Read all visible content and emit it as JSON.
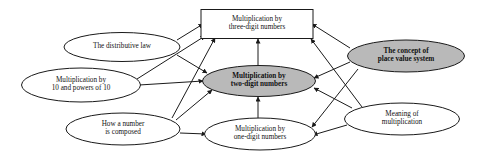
{
  "diagram": {
    "type": "concept-map",
    "colors": {
      "shaded_fill": "#b9b9b9",
      "plain_fill": "#ffffff",
      "stroke": "#1a1a1a",
      "text": "#111111",
      "background": "#ffffff"
    },
    "nodes": [
      {
        "id": "three-digit",
        "label": "Multiplication by\nthree-digit numbers",
        "shape": "rectangle",
        "style": "plain",
        "cx": 257,
        "cy": 24,
        "w": 112,
        "h": 29
      },
      {
        "id": "distributive-law",
        "label": "The distributive law",
        "shape": "ellipse",
        "style": "plain",
        "cx": 122,
        "cy": 47,
        "w": 116,
        "h": 29
      },
      {
        "id": "powers-of-ten",
        "label": "Multiplication by\n10 and powers of 10",
        "shape": "ellipse",
        "style": "plain",
        "cx": 81,
        "cy": 85,
        "w": 119,
        "h": 34
      },
      {
        "id": "two-digit",
        "label": "Multiplication by\ntwo-digit numbers",
        "shape": "ellipse",
        "style": "shaded",
        "cx": 259,
        "cy": 81,
        "w": 113,
        "h": 31
      },
      {
        "id": "place-value",
        "label": "The concept of\nplace value system",
        "shape": "ellipse",
        "style": "shaded",
        "cx": 406,
        "cy": 56,
        "w": 117,
        "h": 32
      },
      {
        "id": "how-composed",
        "label": "How a number\nis composed",
        "shape": "ellipse",
        "style": "plain",
        "cx": 123,
        "cy": 129,
        "w": 114,
        "h": 32
      },
      {
        "id": "one-digit",
        "label": "Multiplication by\none-digit numbers",
        "shape": "ellipse",
        "style": "plain",
        "cx": 260,
        "cy": 134,
        "w": 111,
        "h": 32
      },
      {
        "id": "meaning",
        "label": "Meaning of\nmultiplication",
        "shape": "ellipse",
        "style": "plain",
        "cx": 402,
        "cy": 119,
        "w": 115,
        "h": 32
      }
    ],
    "edges": [
      {
        "from": "distributive-law",
        "to": "three-digit",
        "x1": 177,
        "y1": 40,
        "x2": 203,
        "y2": 24
      },
      {
        "from": "distributive-law",
        "to": "two-digit",
        "x1": 177,
        "y1": 55,
        "x2": 207,
        "y2": 73
      },
      {
        "from": "powers-of-ten",
        "to": "three-digit",
        "x1": 137,
        "y1": 79,
        "x2": 205,
        "y2": 36
      },
      {
        "from": "powers-of-ten",
        "to": "two-digit",
        "x1": 139,
        "y1": 85,
        "x2": 203,
        "y2": 81
      },
      {
        "from": "how-composed",
        "to": "three-digit",
        "x1": 172,
        "y1": 118,
        "x2": 215,
        "y2": 38
      },
      {
        "from": "how-composed",
        "to": "two-digit",
        "x1": 176,
        "y1": 120,
        "x2": 212,
        "y2": 90
      },
      {
        "from": "how-composed",
        "to": "one-digit",
        "x1": 180,
        "y1": 133,
        "x2": 206,
        "y2": 134
      },
      {
        "from": "one-digit",
        "to": "two-digit",
        "x1": 258,
        "y1": 118,
        "x2": 258,
        "y2": 97
      },
      {
        "from": "two-digit",
        "to": "three-digit",
        "x1": 258,
        "y1": 66,
        "x2": 258,
        "y2": 39
      },
      {
        "from": "place-value",
        "to": "three-digit",
        "x1": 350,
        "y1": 48,
        "x2": 312,
        "y2": 24
      },
      {
        "from": "place-value",
        "to": "two-digit",
        "x1": 350,
        "y1": 62,
        "x2": 314,
        "y2": 78
      },
      {
        "from": "place-value",
        "to": "one-digit",
        "x1": 358,
        "y1": 69,
        "x2": 312,
        "y2": 127
      },
      {
        "from": "meaning",
        "to": "three-digit",
        "x1": 362,
        "y1": 107,
        "x2": 311,
        "y2": 39
      },
      {
        "from": "meaning",
        "to": "two-digit",
        "x1": 352,
        "y1": 108,
        "x2": 314,
        "y2": 88
      },
      {
        "from": "meaning",
        "to": "one-digit",
        "x1": 347,
        "y1": 125,
        "x2": 313,
        "y2": 135
      }
    ]
  }
}
